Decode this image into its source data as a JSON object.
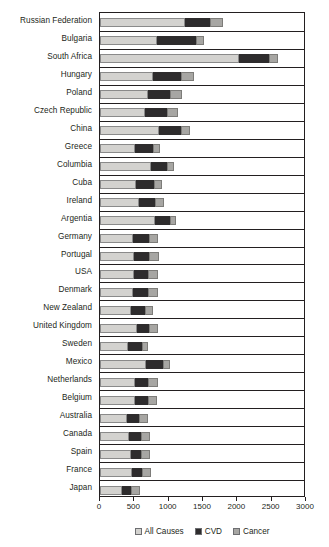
{
  "chart_data": {
    "type": "bar",
    "orientation": "horizontal",
    "stacked": true,
    "title": "",
    "xlabel": "",
    "ylabel": "",
    "xlim": [
      0,
      3000
    ],
    "xticks": [
      0,
      500,
      1000,
      1500,
      2000,
      2500,
      3000
    ],
    "xtick_labels": [
      "0",
      "500",
      "1000",
      "1500",
      "2000",
      "2500",
      "3000"
    ],
    "grid": false,
    "legend_position": "bottom",
    "series": [
      {
        "name": "All Causes",
        "color": "#d3d2cf",
        "values": [
          1240,
          830,
          2020,
          775,
          700,
          660,
          855,
          510,
          740,
          525,
          570,
          800,
          480,
          500,
          490,
          480,
          450,
          535,
          405,
          670,
          515,
          515,
          400,
          420,
          450,
          460,
          320
        ]
      },
      {
        "name": "CVD",
        "color": "#2e2c2d",
        "values": [
          360,
          570,
          440,
          405,
          320,
          315,
          325,
          265,
          235,
          260,
          230,
          220,
          230,
          215,
          215,
          215,
          210,
          180,
          205,
          245,
          180,
          185,
          170,
          180,
          145,
          150,
          130
        ]
      },
      {
        "name": "Cancer",
        "color": "#a7a6a3",
        "values": [
          190,
          115,
          130,
          190,
          175,
          160,
          130,
          95,
          105,
          115,
          130,
          90,
          135,
          140,
          135,
          145,
          115,
          125,
          90,
          105,
          150,
          130,
          130,
          125,
          130,
          130,
          130
        ]
      }
    ],
    "categories": [
      "Russian Federation",
      "Bulgaria",
      "South Africa",
      "Hungary",
      "Poland",
      "Czech Republic",
      "China",
      "Greece",
      "Columbia",
      "Cuba",
      "Ireland",
      "Argentia",
      "Germany",
      "Portugal",
      "USA",
      "Denmark",
      "New Zealand",
      "United Kingdom",
      "Sweden",
      "Mexico",
      "Netherlands",
      "Belgium",
      "Australia",
      "Canada",
      "Spain",
      "France",
      "Japan"
    ],
    "totals": [
      1790,
      1515,
      2590,
      1370,
      1195,
      1135,
      1310,
      870,
      1080,
      900,
      930,
      1110,
      845,
      855,
      840,
      840,
      775,
      840,
      700,
      1020,
      845,
      830,
      700,
      725,
      725,
      740,
      580
    ]
  },
  "legend": {
    "items": [
      {
        "label": "All Causes",
        "color": "#d3d2cf",
        "swatch_name": "legend-swatch-all-causes"
      },
      {
        "label": "CVD",
        "color": "#2e2c2d",
        "swatch_name": "legend-swatch-cvd"
      },
      {
        "label": "Cancer",
        "color": "#a7a6a3",
        "swatch_name": "legend-swatch-cancer"
      }
    ]
  }
}
